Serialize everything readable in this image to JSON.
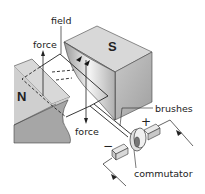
{
  "diagram": {
    "type": "dc-motor-schematic",
    "poles": {
      "north": "N",
      "south": "S"
    },
    "labels": {
      "field": "field",
      "force_top": "force",
      "force_bottom": "force",
      "brushes": "brushes",
      "commutator": "commutator",
      "plus": "+",
      "minus": "−"
    },
    "colors": {
      "magnet_top": "#d9d9d9",
      "magnet_front": "#a8a8a8",
      "magnet_side": "#bdbdbd",
      "outline": "#333333",
      "background": "#ffffff"
    }
  }
}
